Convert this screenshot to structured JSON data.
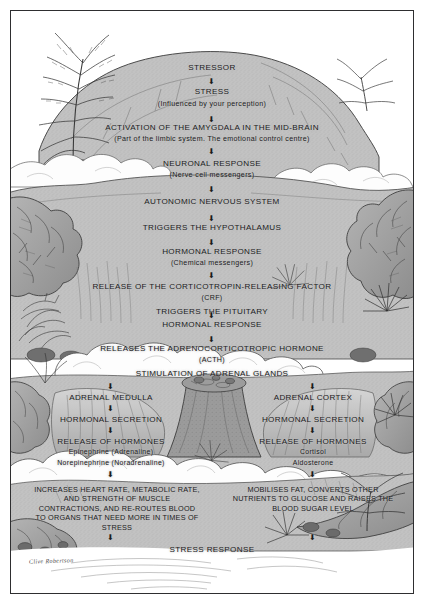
{
  "artwork": {
    "title": "Stress Response Flowchart",
    "signature": "Clive Robertson",
    "style": "hand-drawn grayscale landscape",
    "colors": {
      "paper": "#ffffff",
      "border": "#2e2e30",
      "rock_light": "#c6c6c6",
      "rock_mid": "#a9a9a9",
      "rock_dark": "#7d7d7d",
      "ink": "#1b1b1d",
      "cloud": "#fdfdfd",
      "water": "#bdbdbd"
    }
  },
  "flow": {
    "stressor": "STRESSOR",
    "stress": "STRESS",
    "stress_note": "(Influenced by your perception)",
    "amygdala": "ACTIVATION OF THE AMYGDALA IN THE MID-BRAIN",
    "amygdala_note": "(Part of the limbic system.  The emotional control centre)",
    "neuronal": "NEURONAL RESPONSE",
    "neuronal_note": "(Nerve cell messengers)",
    "ans": "AUTONOMIC NERVOUS SYSTEM",
    "hypothalamus": "TRIGGERS THE HYPOTHALAMUS",
    "hormonal_1": "HORMONAL RESPONSE",
    "hormonal_1_note": "(Chemical messengers)",
    "crf": "RELEASE OF THE CORTICOTROPIN-RELEASING FACTOR",
    "crf_abbr": "(CRF)",
    "pituitary": "TRIGGERS THE PITUITARY",
    "hormonal_2": "HORMONAL RESPONSE",
    "acth": "RELEASES THE ADRENOCORTICOTROPIC HORMONE",
    "acth_abbr": "(ACTH)",
    "stimulation": "STIMULATION OF ADRENAL GLANDS",
    "stress_response": "STRESS RESPONSE"
  },
  "branches": {
    "left": {
      "gland": "ADRENAL MEDULLA",
      "secretion": "HORMONAL SECRETION",
      "release": "RELEASE OF HORMONES",
      "hormones": [
        "Epinephrine (Adrenaline)",
        "Norepinephrine (Noradrenaline)"
      ],
      "outcome": "INCREASES HEART RATE, METABOLIC RATE, AND STRENGTH OF MUSCLE CONTRACTIONS, AND RE-ROUTES BLOOD TO ORGANS THAT NEED MORE IN TIMES OF STRESS"
    },
    "right": {
      "gland": "ADRENAL CORTEX",
      "secretion": "HORMONAL SECRETION",
      "release": "RELEASE OF HORMONES",
      "hormones": [
        "Cortisol",
        "Aldosterone"
      ],
      "outcome": "MOBILISES FAT, CONVERTS OTHER NUTRIENTS TO GLUCOSE AND RAISES THE BLOOD SUGAR LEVEL"
    }
  }
}
